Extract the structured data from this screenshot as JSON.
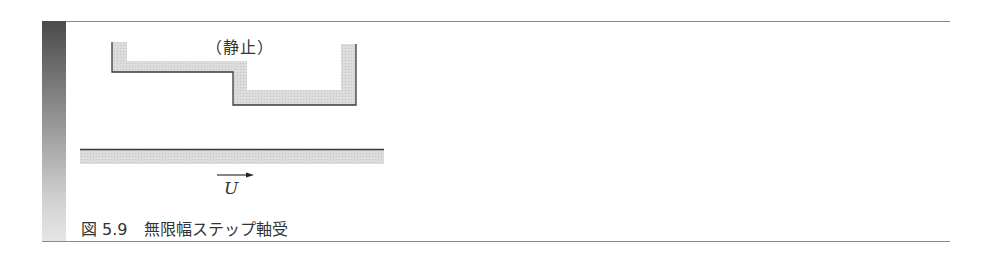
{
  "figure": {
    "caption": "図 5.9　無限幅ステップ軸受",
    "figure_number": "5.9",
    "title": "無限幅ステップ軸受"
  },
  "diagram": {
    "upper_part_label": "（静止）",
    "lower_part_velocity_label": "U",
    "lower_part_velocity_direction": "right",
    "colors": {
      "outline": "#3a3a3a",
      "fill_shading": "#d4d4d4",
      "side_bar_top": "#4a4a4a",
      "side_bar_bottom": "#e6e6e6",
      "rule": "#8a8a8a"
    }
  }
}
